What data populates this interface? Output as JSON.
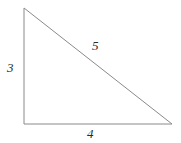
{
  "figure": {
    "name": "right-triangle",
    "background_color": "#ffffff",
    "stroke_color": "#8a8a8a",
    "label_color": "#2b2b2b",
    "stroke_width": 1,
    "vertices": {
      "apex": {
        "x": 24,
        "y": 8
      },
      "bottom_left": {
        "x": 24,
        "y": 124
      },
      "bottom_right": {
        "x": 172,
        "y": 124
      }
    },
    "labels": {
      "vertical_leg": "3",
      "hypotenuse": "5",
      "base": "4"
    }
  },
  "chart_data": {
    "type": "diagram",
    "title": "",
    "shape": "right triangle",
    "sides": [
      {
        "name": "vertical leg",
        "label": "3",
        "value": 3,
        "from": "apex",
        "to": "bottom_left"
      },
      {
        "name": "base",
        "label": "4",
        "value": 4,
        "from": "bottom_left",
        "to": "bottom_right"
      },
      {
        "name": "hypotenuse",
        "label": "5",
        "value": 5,
        "from": "apex",
        "to": "bottom_right"
      }
    ],
    "right_angle_at": "bottom_left"
  }
}
